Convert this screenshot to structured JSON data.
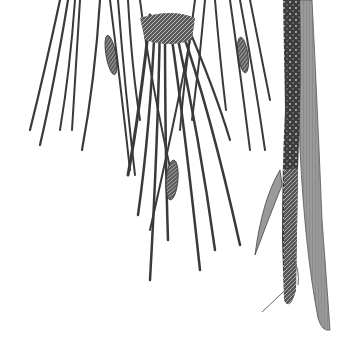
{
  "image": {
    "subject": "Botanical engraving of a pine-like branch with long needles, small cones, and a textured stem",
    "width": 354,
    "height": 349,
    "background": "#ffffff",
    "ink_color": "#3a3a3a",
    "stem_color": "#555555",
    "blade_color": "#8a8a8a"
  },
  "needles": [
    {
      "d": "M60 0 Q45 70 30 130",
      "w": 2.2
    },
    {
      "d": "M68 0 Q55 80 40 145",
      "w": 2.2
    },
    {
      "d": "M75 0 Q70 70 60 130",
      "w": 2
    },
    {
      "d": "M80 0 Q75 80 72 130",
      "w": 2
    },
    {
      "d": "M100 0 Q95 80 82 150",
      "w": 2.2
    },
    {
      "d": "M110 0 Q120 80 130 170",
      "w": 2
    },
    {
      "d": "M118 0 Q125 90 135 175",
      "w": 2
    },
    {
      "d": "M128 0 Q132 70 140 120",
      "w": 2
    },
    {
      "d": "M150 15 Q140 110 128 175",
      "w": 3
    },
    {
      "d": "M155 20 Q150 130 138 215",
      "w": 2.5
    },
    {
      "d": "M160 20 Q158 140 150 280",
      "w": 2.5
    },
    {
      "d": "M165 20 Q165 150 168 240",
      "w": 2.5
    },
    {
      "d": "M170 25 Q185 130 200 270",
      "w": 2.5
    },
    {
      "d": "M175 25 Q200 140 215 250",
      "w": 2.5
    },
    {
      "d": "M180 25 Q210 110 240 245",
      "w": 2.5
    },
    {
      "d": "M185 20 Q215 90 230 140",
      "w": 2.2
    },
    {
      "d": "M195 0 Q185 70 180 130",
      "w": 2
    },
    {
      "d": "M205 0 Q200 60 192 120",
      "w": 2
    },
    {
      "d": "M215 0 Q220 60 226 110",
      "w": 2
    },
    {
      "d": "M230 0 Q240 70 250 150",
      "w": 2
    },
    {
      "d": "M240 0 Q255 80 265 150",
      "w": 2
    },
    {
      "d": "M250 0 Q262 60 270 100",
      "w": 2
    },
    {
      "d": "M140 0 Q150 80 175 190",
      "w": 2
    },
    {
      "d": "M190 40 Q175 120 150 230",
      "w": 2
    }
  ],
  "cones": [
    {
      "cx": 111,
      "cy": 55,
      "rx": 5,
      "ry": 20,
      "rot": -10
    },
    {
      "cx": 243,
      "cy": 55,
      "rx": 5,
      "ry": 18,
      "rot": -8
    },
    {
      "cx": 172,
      "cy": 180,
      "rx": 6,
      "ry": 20,
      "rot": 5
    }
  ]
}
